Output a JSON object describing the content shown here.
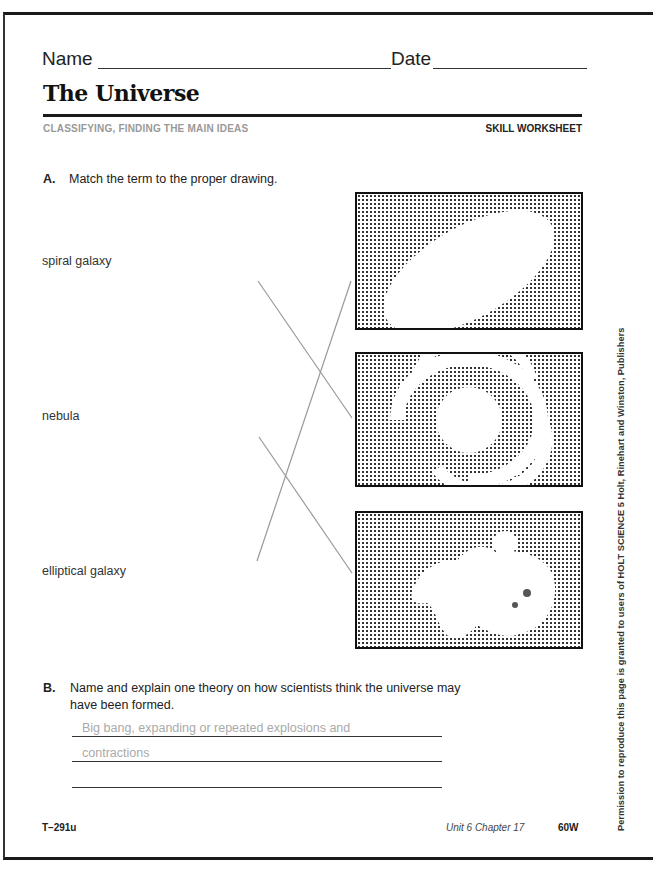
{
  "header": {
    "name_label": "Name",
    "date_label": "Date",
    "title": "The Universe",
    "subtitle": "CLASSIFYING,  FINDING THE MAIN IDEAS",
    "worksheet_type": "SKILL WORKSHEET"
  },
  "section_a": {
    "label": "A.",
    "instruction": "Match the term to the proper drawing.",
    "terms": [
      {
        "label": "spiral galaxy"
      },
      {
        "label": "nebula"
      },
      {
        "label": "elliptical galaxy"
      }
    ],
    "drawings": [
      {
        "icon": "elliptical-galaxy-drawing"
      },
      {
        "icon": "spiral-galaxy-drawing"
      },
      {
        "icon": "nebula-drawing"
      }
    ],
    "matches": [
      {
        "term": "spiral galaxy",
        "drawing": 2
      },
      {
        "term": "nebula",
        "drawing": 3
      },
      {
        "term": "elliptical galaxy",
        "drawing": 1
      }
    ]
  },
  "section_b": {
    "label": "B.",
    "question": "Name and explain one theory on how scientists think the universe may have been formed.",
    "answer_lines": [
      "Big bang, expanding or repeated explosions and",
      "contractions",
      ""
    ]
  },
  "footer": {
    "code": "T–291u",
    "unit": "Unit 6 Chapter 17",
    "page": "60W"
  },
  "side_credit": "Permission to reproduce this page is granted to users of HOLT SCIENCE 5     Holt, Rinehart and Winston, Publishers"
}
